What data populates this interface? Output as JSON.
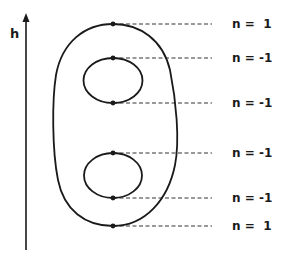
{
  "diagram": {
    "axis": {
      "label": "h",
      "direction": "up"
    },
    "outer_contour": {
      "shape": "closed-curve"
    },
    "inner_contours": [
      {
        "shape": "ellipse",
        "position": "upper"
      },
      {
        "shape": "ellipse",
        "position": "lower"
      }
    ],
    "critical_levels": [
      {
        "label": "n =  1",
        "y": 24
      },
      {
        "label": "n = -1",
        "y": 58
      },
      {
        "label": "n = -1",
        "y": 103
      },
      {
        "label": "n = -1",
        "y": 153
      },
      {
        "label": "n = -1",
        "y": 198
      },
      {
        "label": "n =  1",
        "y": 226
      }
    ],
    "colors": {
      "stroke": "#1a1a1a",
      "background": "#ffffff"
    }
  }
}
